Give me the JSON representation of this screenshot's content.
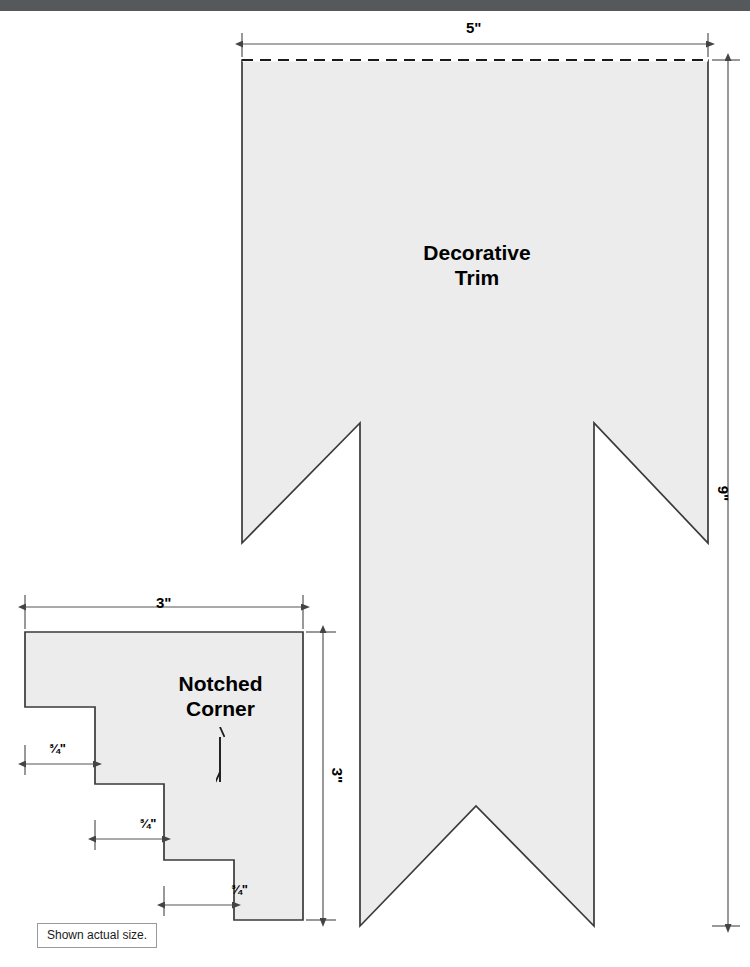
{
  "page": {
    "note_label": "Shown actual size.",
    "fill_color": "#ececec",
    "outline_color": "#3a3a3a",
    "dimension_color": "#555555",
    "band_color": "#55595c"
  },
  "pieces": [
    {
      "id": "decorative-trim",
      "name_line1": "Decorative",
      "name_line2": "Trim",
      "width_label": "5\"",
      "height_label": "9\"",
      "top_edge_style": "dashed"
    },
    {
      "id": "notched-corner",
      "name_line1": "Notched",
      "name_line2": "Corner",
      "width_label": "3\"",
      "height_label": "3\"",
      "step_labels": [
        {
          "whole": "",
          "num": "3",
          "den": "4",
          "unit": "\""
        },
        {
          "whole": "",
          "num": "3",
          "den": "4",
          "unit": "\""
        },
        {
          "whole": "",
          "num": "3",
          "den": "4",
          "unit": "\""
        }
      ]
    }
  ],
  "dimensions": {
    "trim_width": "5\"",
    "trim_height": "9\"",
    "corner_width": "3\"",
    "corner_height": "3\"",
    "step_1": "¾\"",
    "step_2": "¾\"",
    "step_3": "¾\""
  }
}
